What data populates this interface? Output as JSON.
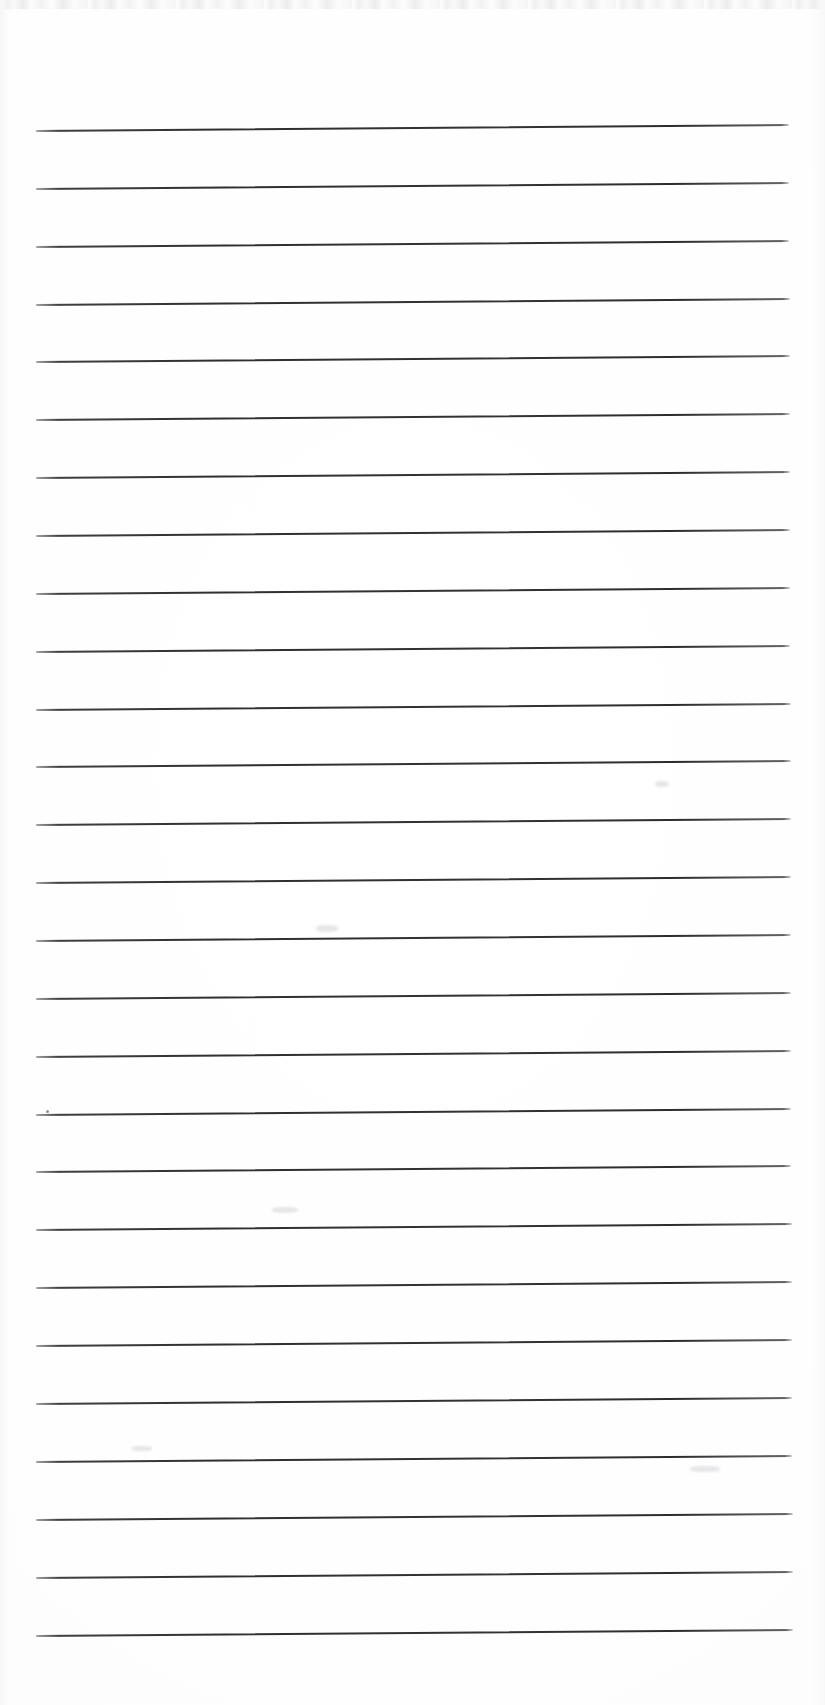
{
  "document": {
    "kind": "scanned-lined-notebook-page",
    "title": "Lined Notebook Page",
    "page_width": 825,
    "page_height": 1705,
    "background_color": "#ffffff",
    "ink_color": "#2e2e34",
    "text_content": "",
    "handwriting_present": "none",
    "printed_text_present": "none"
  },
  "ruling": {
    "line_count": 27,
    "line_color": "#2e2e34",
    "line_thickness_px": 2,
    "left_margin_px": 36,
    "right_margin_px": 791,
    "first_line_y_px": 130,
    "line_spacing_px": 57.9,
    "skew_degrees": -0.45,
    "lines": [
      {
        "index": 1,
        "y": 130,
        "x_start": 36,
        "x_end": 789
      },
      {
        "index": 2,
        "y": 188,
        "x_start": 36,
        "x_end": 789
      },
      {
        "index": 3,
        "y": 246,
        "x_start": 36,
        "x_end": 789
      },
      {
        "index": 4,
        "y": 304,
        "x_start": 36,
        "x_end": 790
      },
      {
        "index": 5,
        "y": 361,
        "x_start": 36,
        "x_end": 790
      },
      {
        "index": 6,
        "y": 419,
        "x_start": 36,
        "x_end": 790
      },
      {
        "index": 7,
        "y": 477,
        "x_start": 36,
        "x_end": 790
      },
      {
        "index": 8,
        "y": 535,
        "x_start": 36,
        "x_end": 790
      },
      {
        "index": 9,
        "y": 593,
        "x_start": 36,
        "x_end": 790
      },
      {
        "index": 10,
        "y": 651,
        "x_start": 36,
        "x_end": 790
      },
      {
        "index": 11,
        "y": 709,
        "x_start": 36,
        "x_end": 791
      },
      {
        "index": 12,
        "y": 766,
        "x_start": 36,
        "x_end": 791
      },
      {
        "index": 13,
        "y": 824,
        "x_start": 36,
        "x_end": 791
      },
      {
        "index": 14,
        "y": 882,
        "x_start": 36,
        "x_end": 791
      },
      {
        "index": 15,
        "y": 940,
        "x_start": 36,
        "x_end": 791
      },
      {
        "index": 16,
        "y": 998,
        "x_start": 36,
        "x_end": 791
      },
      {
        "index": 17,
        "y": 1056,
        "x_start": 36,
        "x_end": 791
      },
      {
        "index": 18,
        "y": 1114,
        "x_start": 36,
        "x_end": 791
      },
      {
        "index": 19,
        "y": 1171,
        "x_start": 36,
        "x_end": 791
      },
      {
        "index": 20,
        "y": 1229,
        "x_start": 36,
        "x_end": 792
      },
      {
        "index": 21,
        "y": 1287,
        "x_start": 36,
        "x_end": 792
      },
      {
        "index": 22,
        "y": 1345,
        "x_start": 36,
        "x_end": 792
      },
      {
        "index": 23,
        "y": 1403,
        "x_start": 36,
        "x_end": 792
      },
      {
        "index": 24,
        "y": 1461,
        "x_start": 36,
        "x_end": 792
      },
      {
        "index": 25,
        "y": 1519,
        "x_start": 36,
        "x_end": 793
      },
      {
        "index": 26,
        "y": 1577,
        "x_start": 36,
        "x_end": 793
      },
      {
        "index": 27,
        "y": 1635,
        "x_start": 36,
        "x_end": 793
      }
    ]
  },
  "artifacts": {
    "top_edge_band": {
      "y": 0,
      "height": 9,
      "description": "faint grey scanner edge streak"
    },
    "specks": [
      {
        "x": 46,
        "y": 1110,
        "size": 3
      }
    ],
    "smudges": [
      {
        "x": 655,
        "y": 781,
        "w": 14,
        "h": 6
      },
      {
        "x": 316,
        "y": 925,
        "w": 22,
        "h": 7
      },
      {
        "x": 272,
        "y": 1207,
        "w": 26,
        "h": 6
      },
      {
        "x": 132,
        "y": 1446,
        "w": 20,
        "h": 5
      },
      {
        "x": 690,
        "y": 1466,
        "w": 30,
        "h": 6
      }
    ]
  }
}
